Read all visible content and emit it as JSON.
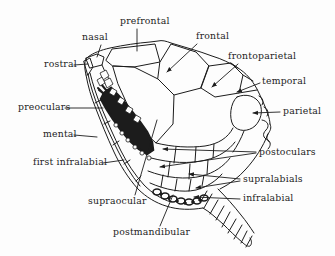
{
  "figure": {
    "background": "#fdfdfd",
    "ink": "#1c1c1c",
    "labels": [
      {
        "id": "prefrontal",
        "text": "prefrontal",
        "x": 120,
        "y": 16
      },
      {
        "id": "nasal",
        "text": "nasal",
        "x": 82,
        "y": 32
      },
      {
        "id": "frontal",
        "text": "frontal",
        "x": 196,
        "y": 31
      },
      {
        "id": "frontoparietal",
        "text": "frontoparietal",
        "x": 228,
        "y": 51
      },
      {
        "id": "rostral",
        "text": "rostral",
        "x": 44,
        "y": 59
      },
      {
        "id": "temporal",
        "text": "temporal",
        "x": 262,
        "y": 76
      },
      {
        "id": "preoculars",
        "text": "preoculars",
        "x": 18,
        "y": 102
      },
      {
        "id": "parietal",
        "text": "parietal",
        "x": 283,
        "y": 106
      },
      {
        "id": "mental",
        "text": "mental",
        "x": 43,
        "y": 129
      },
      {
        "id": "postoculars",
        "text": "postoculars",
        "x": 259,
        "y": 147
      },
      {
        "id": "first-infralabial",
        "text": "first infralabial",
        "x": 33,
        "y": 157
      },
      {
        "id": "supralabials",
        "text": "supralabials",
        "x": 243,
        "y": 174
      },
      {
        "id": "supraocular",
        "text": "supraocular",
        "x": 88,
        "y": 196
      },
      {
        "id": "infralabial",
        "text": "infralabial",
        "x": 243,
        "y": 193
      },
      {
        "id": "postmandibular",
        "text": "postmandibular",
        "x": 113,
        "y": 227
      }
    ]
  }
}
